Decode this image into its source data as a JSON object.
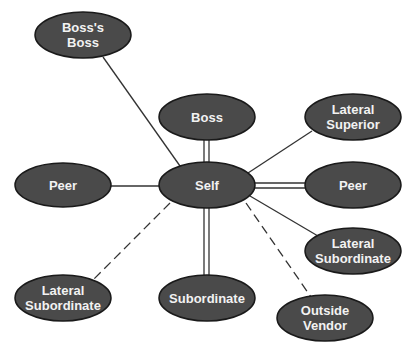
{
  "diagram": {
    "type": "relationship-network",
    "colors": {
      "node_fill": "#4a4a4a",
      "node_stroke": "#1a1a1a",
      "text": "#f2f2f2",
      "line": "#333333"
    },
    "nodes": [
      {
        "id": "bosss_boss",
        "label": "Boss's\nBoss",
        "cx": 83,
        "cy": 35
      },
      {
        "id": "boss",
        "label": "Boss",
        "cx": 207,
        "cy": 117
      },
      {
        "id": "lateral_superior",
        "label": "Lateral\nSuperior",
        "cx": 353,
        "cy": 117
      },
      {
        "id": "peer_left",
        "label": "Peer",
        "cx": 63,
        "cy": 185
      },
      {
        "id": "self",
        "label": "Self",
        "cx": 207,
        "cy": 185
      },
      {
        "id": "peer_right",
        "label": "Peer",
        "cx": 353,
        "cy": 185
      },
      {
        "id": "lateral_subordinate_right",
        "label": "Lateral\nSubordinate",
        "cx": 353,
        "cy": 251
      },
      {
        "id": "lateral_subordinate_left",
        "label": "Lateral\nSubordinate",
        "cx": 63,
        "cy": 298
      },
      {
        "id": "subordinate",
        "label": "Subordinate",
        "cx": 207,
        "cy": 298
      },
      {
        "id": "outside_vendor",
        "label": "Outside\nVendor",
        "cx": 325,
        "cy": 318
      }
    ],
    "edges": [
      {
        "from": "self",
        "to": "bosss_boss",
        "style": "solid"
      },
      {
        "from": "self",
        "to": "boss",
        "style": "double"
      },
      {
        "from": "self",
        "to": "lateral_superior",
        "style": "solid"
      },
      {
        "from": "self",
        "to": "peer_left",
        "style": "solid"
      },
      {
        "from": "self",
        "to": "peer_right",
        "style": "double"
      },
      {
        "from": "self",
        "to": "lateral_subordinate_right",
        "style": "solid"
      },
      {
        "from": "self",
        "to": "lateral_subordinate_left",
        "style": "dashed"
      },
      {
        "from": "self",
        "to": "subordinate",
        "style": "double"
      },
      {
        "from": "self",
        "to": "outside_vendor",
        "style": "dashed"
      }
    ]
  },
  "labels": {
    "bosss_boss": "Boss's\nBoss",
    "boss": "Boss",
    "lateral_superior": "Lateral\nSuperior",
    "peer_left": "Peer",
    "self": "Self",
    "peer_right": "Peer",
    "lateral_subordinate_right": "Lateral\nSubordinate",
    "lateral_subordinate_left": "Lateral\nSubordinate",
    "subordinate": "Subordinate",
    "outside_vendor": "Outside\nVendor"
  }
}
